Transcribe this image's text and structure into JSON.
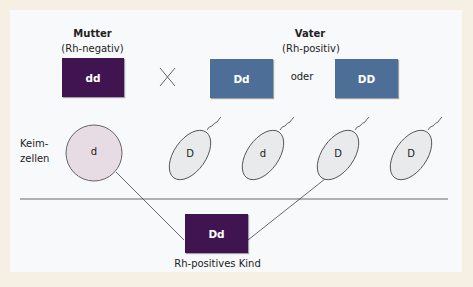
{
  "mother": {
    "title": "Mutter",
    "subtitle": "(Rh-negativ)",
    "genotype": "dd"
  },
  "cross_symbol": "×",
  "father": {
    "title": "Vater",
    "subtitle": "(Rh-positiv)",
    "genotype_1": "Dd",
    "or_label": "oder",
    "genotype_2": "DD"
  },
  "gametes_label": {
    "line1": "Keim-",
    "line2": "zellen"
  },
  "gametes": {
    "egg": "d",
    "sperm": [
      "D",
      "d",
      "D",
      "D"
    ]
  },
  "child": {
    "genotype": "Dd",
    "label": "Rh-positives Kind"
  },
  "colors": {
    "mother_box": "#3f1450",
    "father_box": "#4d6f97",
    "child_box": "#3f1450",
    "egg_fill": "#e8dce4",
    "sperm_fill": "#e8eaec",
    "border": "#f6efe4",
    "panel": "#f7f9fb"
  }
}
